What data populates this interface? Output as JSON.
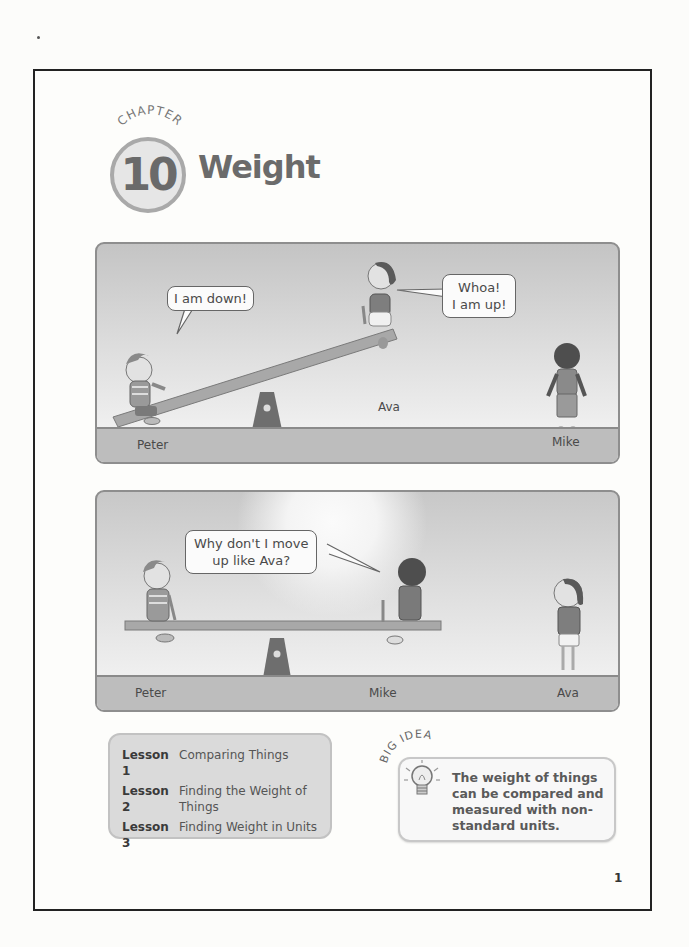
{
  "chapter": {
    "label": "CHAPTER",
    "number": "10",
    "title": "Weight"
  },
  "panels": [
    {
      "id": "panel-1",
      "scene": "Peter down, Ava up on seesaw; Mike standing",
      "bubbles": [
        {
          "speaker": "Peter",
          "text": "I am down!"
        },
        {
          "speaker": "Ava",
          "lines": [
            "Whoa!",
            "I am up!"
          ]
        }
      ],
      "names": {
        "left": "Peter",
        "middle": "Ava",
        "right": "Mike"
      }
    },
    {
      "id": "panel-2",
      "scene": "Peter and Mike level on seesaw; Ava standing",
      "bubbles": [
        {
          "speaker": "Peter",
          "lines": [
            "Why don't I move",
            "up like Ava?"
          ]
        }
      ],
      "names": {
        "left": "Peter",
        "middle": "Mike",
        "right": "Ava"
      }
    }
  ],
  "lessons": [
    {
      "num": "Lesson 1",
      "name": "Comparing Things"
    },
    {
      "num": "Lesson 2",
      "name": "Finding the Weight of Things"
    },
    {
      "num": "Lesson 3",
      "name": "Finding Weight in Units"
    }
  ],
  "big_idea": {
    "label": "BIG IDEA",
    "icon": "lightbulb-icon",
    "text": "The weight of things can be compared and measured with non-standard units."
  },
  "page_number": "1",
  "colors": {
    "ink": "#333333",
    "panel_sky": "#d4d4d4",
    "ground": "#bdbdbd",
    "badge_ring": "#a9a9a9"
  }
}
